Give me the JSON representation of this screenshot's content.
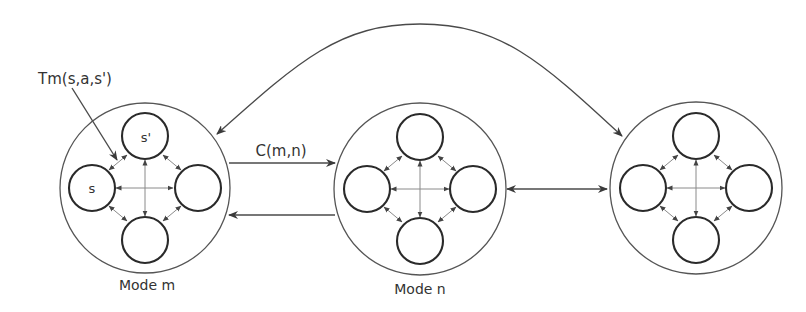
{
  "diagram": {
    "title": "",
    "colors": {
      "background": "#ffffff",
      "outline": "#555555",
      "state_outline": "#2a2a2a",
      "inner_links": "#8a8a8a",
      "connectors": "#4a4a4a",
      "text": "#333333"
    },
    "modes": [
      {
        "id": "m",
        "label": "Mode m",
        "center": [
          145,
          188
        ],
        "radius": 85,
        "states": [
          {
            "pos": "top",
            "label": "s'"
          },
          {
            "pos": "left",
            "label": "s"
          },
          {
            "pos": "right",
            "label": ""
          },
          {
            "pos": "bottom",
            "label": ""
          }
        ]
      },
      {
        "id": "n",
        "label": "Mode n",
        "center": [
          420,
          189
        ],
        "radius": 86,
        "states": [
          {
            "pos": "top",
            "label": ""
          },
          {
            "pos": "left",
            "label": ""
          },
          {
            "pos": "right",
            "label": ""
          },
          {
            "pos": "bottom",
            "label": ""
          }
        ]
      },
      {
        "id": "third",
        "label": "",
        "center": [
          696,
          188
        ],
        "radius": 86,
        "states": [
          {
            "pos": "top",
            "label": ""
          },
          {
            "pos": "left",
            "label": ""
          },
          {
            "pos": "right",
            "label": ""
          },
          {
            "pos": "bottom",
            "label": ""
          }
        ]
      }
    ],
    "edges": [
      {
        "from": "m",
        "to": "n",
        "label": "C(m,n)",
        "direction": "forward"
      },
      {
        "from": "n",
        "to": "m",
        "label": "",
        "direction": "forward"
      },
      {
        "from": "n",
        "to": "third",
        "label": "",
        "direction": "bidirectional"
      },
      {
        "from": "m",
        "to": "third",
        "label": "",
        "direction": "bidirectional",
        "style": "arc-over-top"
      }
    ],
    "annotations": [
      {
        "label": "Tm(s,a,s')",
        "points_to": "transition between s and s' in Mode m"
      }
    ]
  }
}
